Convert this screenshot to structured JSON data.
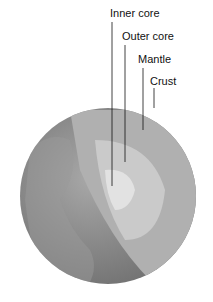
{
  "diagram": {
    "labels": [
      {
        "text": "Inner core",
        "x": 110,
        "y": 7
      },
      {
        "text": "Outer core",
        "x": 122,
        "y": 30
      },
      {
        "text": "Mantle",
        "x": 138,
        "y": 53
      },
      {
        "text": "Crust",
        "x": 150,
        "y": 75
      }
    ],
    "colors": {
      "globe": "#8e8e8e",
      "mantle": "#b4b4b4",
      "outer_core": "#cfcfcf",
      "inner_core": "#e4e4e4"
    }
  }
}
